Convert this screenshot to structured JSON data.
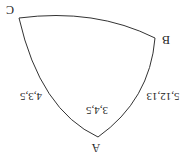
{
  "diagram": {
    "orientation": "rotated 180 degrees",
    "stroke_color": "#333333",
    "vertices": {
      "A": {
        "label": "A"
      },
      "B": {
        "label": "B"
      },
      "C": {
        "label": "C"
      }
    },
    "angle_labels": {
      "A": "3,4,5"
    },
    "edge_labels": {
      "AC": "4,3,5",
      "AB": "5,12,13"
    }
  }
}
